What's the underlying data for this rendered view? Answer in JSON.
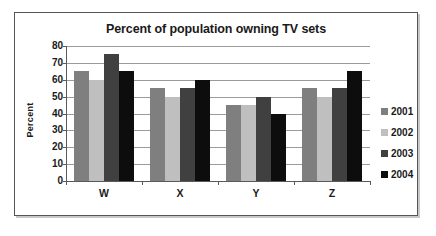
{
  "chart_data": {
    "type": "bar",
    "title": "Percent of population owning TV sets",
    "xlabel": "",
    "ylabel": "Percent",
    "categories": [
      "W",
      "X",
      "Y",
      "Z"
    ],
    "series": [
      {
        "name": "2001",
        "color": "#7f7f7f",
        "values": [
          65,
          55,
          45,
          55
        ]
      },
      {
        "name": "2002",
        "color": "#bfbfbf",
        "values": [
          60,
          50,
          45,
          50
        ]
      },
      {
        "name": "2003",
        "color": "#404040",
        "values": [
          75,
          55,
          50,
          55
        ]
      },
      {
        "name": "2004",
        "color": "#0d0d0d",
        "values": [
          65,
          60,
          40,
          65
        ]
      }
    ],
    "ylim": [
      0,
      80
    ],
    "yticks": [
      0,
      10,
      20,
      30,
      40,
      50,
      60,
      70,
      80
    ],
    "ytick_labels": [
      "0",
      "10",
      "20",
      "30",
      "40",
      "50",
      "60",
      "70",
      "80"
    ],
    "grid": "horizontal",
    "legend_position": "right",
    "bar_mode": "grouped"
  }
}
